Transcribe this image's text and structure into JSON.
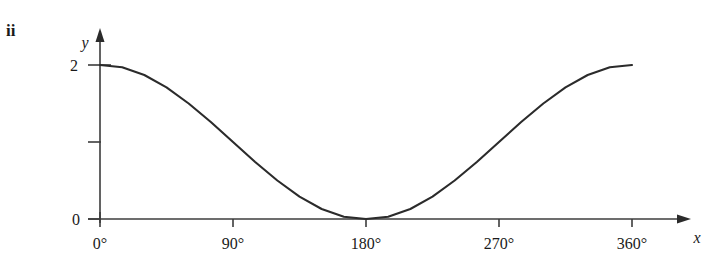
{
  "figure": {
    "part_label": "ii",
    "background_color": "#ffffff",
    "line_color": "#2b2b2b",
    "axis_color": "#3c3c3c"
  },
  "axes": {
    "x_axis_name": "x",
    "y_axis_name": "y",
    "x_tick_labels": [
      "0°",
      "90°",
      "180°",
      "270°",
      "360°"
    ],
    "y_tick_labels": [
      "0",
      "",
      "2"
    ]
  },
  "chart_data": {
    "type": "line",
    "title": "",
    "xlabel": "x",
    "ylabel": "y",
    "xlim": [
      0,
      360
    ],
    "ylim": [
      0,
      2
    ],
    "grid": false,
    "legend": false,
    "x_ticks": [
      0,
      90,
      180,
      270,
      360
    ],
    "x_tick_labels": [
      "0°",
      "90°",
      "180°",
      "270°",
      "360°"
    ],
    "y_ticks": [
      0,
      1,
      2
    ],
    "y_tick_labels": [
      "0",
      "",
      "2"
    ],
    "series": [
      {
        "name": "y = 1 + cos x",
        "x": [
          0,
          15,
          30,
          45,
          60,
          75,
          90,
          105,
          120,
          135,
          150,
          165,
          180,
          195,
          210,
          225,
          240,
          255,
          270,
          285,
          300,
          315,
          330,
          345,
          360
        ],
        "values": [
          2.0,
          1.97,
          1.87,
          1.71,
          1.5,
          1.26,
          1.0,
          0.74,
          0.5,
          0.29,
          0.13,
          0.03,
          0.0,
          0.03,
          0.13,
          0.29,
          0.5,
          0.74,
          1.0,
          1.26,
          1.5,
          1.71,
          1.87,
          1.97,
          2.0
        ]
      }
    ],
    "annotations": [
      "ii"
    ]
  }
}
